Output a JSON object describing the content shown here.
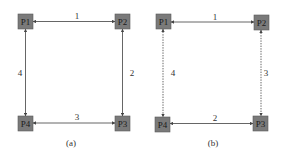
{
  "figure": {
    "panels": [
      {
        "id": "a",
        "caption": "(a)",
        "nodes": [
          {
            "id": "P1",
            "label": "P1"
          },
          {
            "id": "P2",
            "label": "P2"
          },
          {
            "id": "P3",
            "label": "P3"
          },
          {
            "id": "P4",
            "label": "P4"
          }
        ],
        "edges": [
          {
            "from": "P1",
            "to": "P2",
            "label": "1",
            "style": "solid",
            "direction": "bidirectional"
          },
          {
            "from": "P2",
            "to": "P3",
            "label": "2",
            "style": "solid",
            "direction": "bidirectional"
          },
          {
            "from": "P4",
            "to": "P3",
            "label": "3",
            "style": "solid",
            "direction": "bidirectional"
          },
          {
            "from": "P1",
            "to": "P4",
            "label": "4",
            "style": "solid",
            "direction": "bidirectional"
          }
        ]
      },
      {
        "id": "b",
        "caption": "(b)",
        "nodes": [
          {
            "id": "P1",
            "label": "P1"
          },
          {
            "id": "P2",
            "label": "P2"
          },
          {
            "id": "P3",
            "label": "P3"
          },
          {
            "id": "P4",
            "label": "P4"
          }
        ],
        "edges": [
          {
            "from": "P1",
            "to": "P2",
            "label": "1",
            "style": "solid",
            "direction": "bidirectional"
          },
          {
            "from": "P4",
            "to": "P3",
            "label": "2",
            "style": "solid",
            "direction": "bidirectional"
          },
          {
            "from": "P2",
            "to": "P3",
            "label": "3",
            "style": "dashed",
            "direction": "bidirectional"
          },
          {
            "from": "P1",
            "to": "P4",
            "label": "4",
            "style": "dashed",
            "direction": "bidirectional"
          }
        ]
      }
    ]
  },
  "colors": {
    "node_fill": "#7a7a7a",
    "edge": "#555555",
    "background": "#ffffff"
  }
}
